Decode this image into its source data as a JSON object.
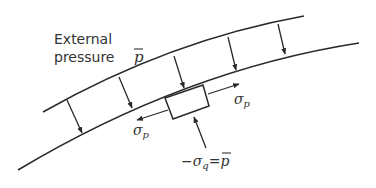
{
  "diagram": {
    "title_line1": "External",
    "title_line2": "pressure",
    "pressure_symbol": "p",
    "sigma_p_right": "σ",
    "sigma_p_right_sub": "p",
    "sigma_p_left": "σ",
    "sigma_p_left_sub": "p",
    "sigma_q_label_prefix": "−σ",
    "sigma_q_sub": "q",
    "sigma_q_equals": "=",
    "sigma_q_rhs": "p",
    "colors": {
      "line": "#2a2a2a",
      "text": "#333333",
      "background": "#ffffff"
    }
  }
}
